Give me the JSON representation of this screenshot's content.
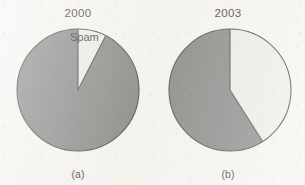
{
  "figure": {
    "background_color": "#f6f4f0",
    "slice_dark_color": "#7b7b79",
    "slice_light_color": "#eceae5",
    "outline_color": "#3c3a37"
  },
  "panels": [
    {
      "id": "a",
      "title": "2000",
      "caption": "(a)",
      "spam_label": "Spam"
    },
    {
      "id": "b",
      "title": "2003",
      "caption": "(b)",
      "spam_label": "Spam"
    }
  ],
  "chart_data": [
    {
      "type": "pie",
      "title": "2000",
      "caption": "(a)",
      "categories": [
        "Spam",
        "Other"
      ],
      "values": [
        7.5,
        92.5
      ],
      "labels": [
        "Spam",
        ""
      ],
      "colors": [
        "#eceae5",
        "#7b7b79"
      ],
      "start_angle_deg": 0,
      "direction": "clockwise",
      "units": "percent of e-mail",
      "legend": "none",
      "grid": false
    },
    {
      "type": "pie",
      "title": "2003",
      "caption": "(b)",
      "categories": [
        "Spam",
        "Other"
      ],
      "values": [
        41,
        59
      ],
      "labels": [
        "Spam",
        ""
      ],
      "colors": [
        "#eceae5",
        "#7b7b79"
      ],
      "start_angle_deg": 0,
      "direction": "clockwise",
      "units": "percent of e-mail",
      "legend": "none",
      "grid": false
    }
  ]
}
